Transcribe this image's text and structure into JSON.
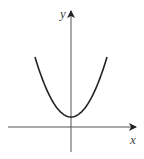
{
  "chart_data": {
    "type": "line",
    "title": "",
    "xlabel": "x",
    "ylabel": "y",
    "function": "y = a*x^2 + c (c > 0)",
    "xlim": [
      -1.75,
      1.75
    ],
    "ylim": [
      -1,
      4
    ],
    "grid": false,
    "ticks": false,
    "series": [
      {
        "name": "parabola",
        "x": [
          -1.0,
          -0.75,
          -0.5,
          -0.25,
          0,
          0.25,
          0.5,
          0.75,
          1.0
        ],
        "y": [
          3.5,
          2.1875,
          1.25,
          0.6875,
          0.5,
          0.6875,
          1.25,
          2.1875,
          3.5
        ]
      }
    ]
  }
}
